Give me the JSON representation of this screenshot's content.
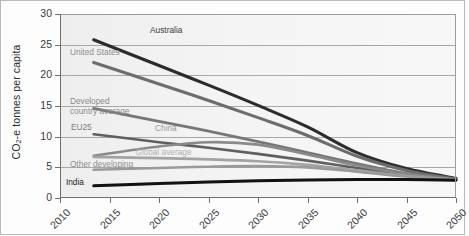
{
  "chart_data": {
    "type": "line",
    "title": "",
    "xlabel": "",
    "ylabel": "CO2-e tonnes per capita",
    "ylabel_prefix": "CO",
    "ylabel_sub": "2",
    "ylabel_suffix": "-e tonnes per capita",
    "x": [
      2010,
      2015,
      2020,
      2025,
      2030,
      2035,
      2040,
      2045,
      2050
    ],
    "xlim": [
      2010,
      2050
    ],
    "ylim": [
      0,
      30
    ],
    "yticks": [
      0,
      5,
      10,
      15,
      20,
      25,
      30
    ],
    "xticks": [
      "2010",
      "2015",
      "2020",
      "2025",
      "2030",
      "2035",
      "2040",
      "2045",
      "2050"
    ],
    "grid": true,
    "legend": "inline-annotations",
    "series": [
      {
        "name": "Australia",
        "color": "#2c2c2c",
        "width": 3.1,
        "label_x": 2019.1,
        "label_y": 27.2,
        "label_color": "#3a3a3a",
        "x": [
          2013.4,
          2020,
          2025,
          2030,
          2035,
          2040,
          2045,
          2050
        ],
        "values": [
          25.8,
          21.6,
          18.4,
          15.1,
          11.6,
          7.4,
          4.8,
          3.2
        ]
      },
      {
        "name": "United States",
        "color": "#6d6d6d",
        "width": 3.1,
        "label_x": 2011.0,
        "label_y": 23.6,
        "label_color": "#8d8d8d",
        "x": [
          2013.4,
          2020,
          2025,
          2030,
          2035,
          2040,
          2045,
          2050
        ],
        "values": [
          22.1,
          18.6,
          15.9,
          13.1,
          10.2,
          6.8,
          4.5,
          3.1
        ]
      },
      {
        "name": "Developed country average",
        "color": "#777777",
        "width": 2.8,
        "label_x": 2011.0,
        "label_y": 15.6,
        "label_color": "#8a8a8a",
        "x": [
          2013.4,
          2020,
          2025,
          2030,
          2035,
          2040,
          2045,
          2050
        ],
        "values": [
          14.6,
          12.5,
          10.9,
          9.2,
          7.4,
          5.6,
          4.0,
          3.0
        ]
      },
      {
        "name": "EU25",
        "color": "#5f5f5f",
        "width": 2.6,
        "label_x": 2011.1,
        "label_y": 11.4,
        "label_color": "#7b7b7b",
        "x": [
          2013.4,
          2020,
          2025,
          2030,
          2035,
          2040,
          2045,
          2050
        ],
        "values": [
          10.4,
          9.1,
          8.2,
          7.2,
          6.1,
          4.9,
          3.8,
          3.0
        ]
      },
      {
        "name": "China",
        "color": "#8a8a8a",
        "width": 2.6,
        "label_x": 2019.6,
        "label_y": 11.3,
        "label_color": "#9a9a9a",
        "x": [
          2013.4,
          2020,
          2025,
          2030,
          2035,
          2040,
          2045,
          2050
        ],
        "values": [
          6.9,
          8.4,
          9.1,
          8.7,
          7.1,
          5.3,
          3.9,
          3.0
        ]
      },
      {
        "name": "Global average",
        "color": "#a3a3a3",
        "width": 2.6,
        "label_x": 2017.6,
        "label_y": 7.4,
        "label_color": "#b0b0b0",
        "x": [
          2013.4,
          2020,
          2025,
          2030,
          2035,
          2040,
          2045,
          2050
        ],
        "values": [
          6.7,
          6.5,
          6.3,
          6.0,
          5.4,
          4.5,
          3.6,
          2.95
        ]
      },
      {
        "name": "Other developing",
        "color": "#9a9a9a",
        "width": 2.6,
        "label_x": 2011.0,
        "label_y": 5.4,
        "label_color": "#8f8f8f",
        "x": [
          2013.4,
          2020,
          2025,
          2030,
          2035,
          2040,
          2045,
          2050
        ],
        "values": [
          4.6,
          4.9,
          5.1,
          5.2,
          5.0,
          4.3,
          3.5,
          2.9
        ]
      },
      {
        "name": "India",
        "color": "#111111",
        "width": 3.0,
        "label_x": 2010.6,
        "label_y": 2.45,
        "label_color": "#1d1d1d",
        "x": [
          2013.4,
          2020,
          2025,
          2030,
          2035,
          2040,
          2045,
          2050
        ],
        "values": [
          2.0,
          2.35,
          2.6,
          2.8,
          2.95,
          3.0,
          3.0,
          2.9
        ]
      }
    ]
  }
}
